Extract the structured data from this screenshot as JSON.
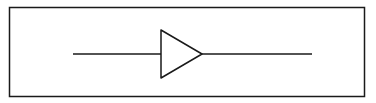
{
  "diagram": {
    "type": "buffer-amplifier-symbol",
    "background": "#ffffff",
    "stroke_color": "#1a1a1a",
    "frame": {
      "x": 9.5,
      "y": 7.5,
      "width": 355,
      "height": 89,
      "stroke_width": 1.5
    },
    "input_line": {
      "x1": 73,
      "y1": 54,
      "x2": 161,
      "y2": 54
    },
    "output_line": {
      "x1": 202,
      "y1": 54,
      "x2": 312,
      "y2": 54
    },
    "triangle": {
      "points": [
        [
          161,
          30
        ],
        [
          161,
          78
        ],
        [
          202,
          54
        ]
      ],
      "stroke_width": 1.5
    }
  }
}
